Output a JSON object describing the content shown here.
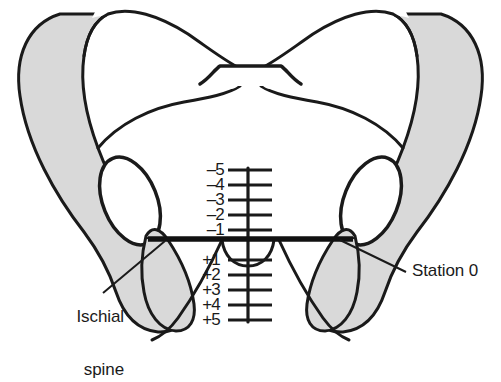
{
  "diagram": {
    "view": "pelvic inlet / anterior view",
    "colors": {
      "bone_fill": "#ffffff",
      "bone_shading": "#d9d9d9",
      "outline": "#1a1a1a",
      "station_line": "#111111",
      "text": "#1a1a1a",
      "background": "#ffffff"
    },
    "labels": [
      {
        "id": "ischial-spine",
        "line1": "Ischial",
        "line2": "spine",
        "leader": "points up-right to the left ischial spine"
      },
      {
        "id": "station-zero",
        "text": "Station 0",
        "leader": "points up-left to the right ischial spine"
      }
    ],
    "scale": {
      "name": "fetal station scale",
      "axis_label": "",
      "unit": "cm relative to ischial spines",
      "zero_label": "Station 0",
      "negative": [
        "–5",
        "–4",
        "–3",
        "–2",
        "–1"
      ],
      "positive": [
        "+1",
        "+2",
        "+3",
        "+4",
        "+5"
      ],
      "ticks": [
        {
          "label": "–5",
          "value": -5,
          "y": 170
        },
        {
          "label": "–4",
          "value": -4,
          "y": 185
        },
        {
          "label": "–3",
          "value": -3,
          "y": 200
        },
        {
          "label": "–2",
          "value": -2,
          "y": 215
        },
        {
          "label": "–1",
          "value": -1,
          "y": 230
        },
        {
          "label": "+1",
          "value": 1,
          "y": 260
        },
        {
          "label": "+2",
          "value": 2,
          "y": 275
        },
        {
          "label": "+3",
          "value": 3,
          "y": 290
        },
        {
          "label": "+4",
          "value": 4,
          "y": 305
        },
        {
          "label": "+5",
          "value": 5,
          "y": 320
        }
      ]
    },
    "structures": [
      "left ilium",
      "right ilium",
      "sacral promontory",
      "left obturator foramen",
      "right obturator foramen",
      "left ischial spine",
      "right ischial spine",
      "left ischial tuberosity",
      "right ischial tuberosity",
      "pubic arch"
    ]
  }
}
